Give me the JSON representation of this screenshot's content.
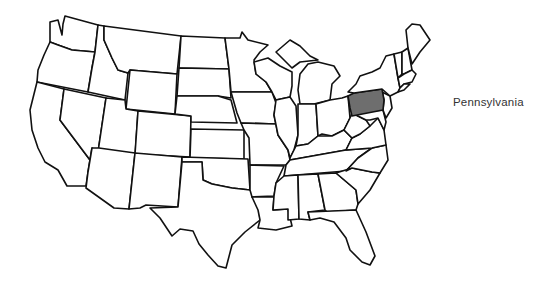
{
  "map": {
    "title": "United States",
    "highlighted_state": "Pennsylvania",
    "highlight_color": "#6e6e6e",
    "outline_color": "#111111",
    "background_color": "#ffffff"
  },
  "label": {
    "text": "Pennsylvania"
  }
}
